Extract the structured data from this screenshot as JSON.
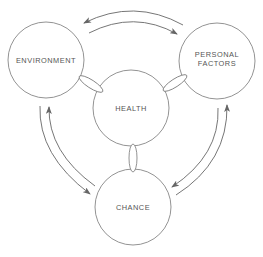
{
  "diagram": {
    "nodes": [
      {
        "id": "environment",
        "lines": [
          "ENVIRONMENT"
        ],
        "cx": 46,
        "cy": 60,
        "r": 38
      },
      {
        "id": "personal-factors",
        "lines": [
          "PERSONAL",
          "FACTORS"
        ],
        "cx": 217,
        "cy": 61,
        "r": 38
      },
      {
        "id": "health",
        "lines": [
          "HEALTH"
        ],
        "cx": 131,
        "cy": 108,
        "r": 38
      },
      {
        "id": "chance",
        "lines": [
          "CHANCE"
        ],
        "cx": 133,
        "cy": 207,
        "r": 38
      }
    ],
    "links": [
      {
        "from": "environment",
        "to": "health",
        "type": "chain-link"
      },
      {
        "from": "personal-factors",
        "to": "health",
        "type": "chain-link"
      },
      {
        "from": "health",
        "to": "chance",
        "type": "chain-link"
      }
    ],
    "arrows": [
      {
        "from": "personal-factors",
        "to": "environment"
      },
      {
        "from": "environment",
        "to": "personal-factors"
      },
      {
        "from": "environment",
        "to": "chance"
      },
      {
        "from": "chance",
        "to": "environment"
      },
      {
        "from": "personal-factors",
        "to": "chance"
      },
      {
        "from": "chance",
        "to": "personal-factors"
      }
    ],
    "colors": {
      "stroke": "#777777",
      "text": "#555555",
      "background": "#ffffff"
    }
  }
}
